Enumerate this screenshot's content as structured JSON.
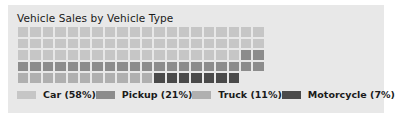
{
  "chart_data": {
    "type": "waffle",
    "title": "Vehicle Sales by Vehicle Type",
    "xlabel": "",
    "ylabel": "",
    "grid_columns": 20,
    "grid_rows": 5,
    "total_cells": 100,
    "fill_order": "bottom-left to top-right, column-major within rows",
    "legend_position": "bottom",
    "categories": [
      "Car",
      "Pickup",
      "Truck",
      "Motorcycle"
    ],
    "values": [
      58,
      21,
      11,
      7
    ],
    "value_unit": "percent",
    "series": [
      {
        "name": "Car",
        "value": 58,
        "label": "Car (58%)",
        "color": "#c6c6c6",
        "cells": 58
      },
      {
        "name": "Pickup",
        "value": 21,
        "label": "Pickup (21%)",
        "color": "#8c8c8c",
        "cells": 21
      },
      {
        "name": "Truck",
        "value": 11,
        "label": "Truck (11%)",
        "color": "#b0b0b0",
        "cells": 11
      },
      {
        "name": "Motorcycle",
        "value": 7,
        "label": "Motorcycle (7%)",
        "color": "#4a4a4a",
        "cells": 7
      }
    ],
    "empty_cells": 4,
    "empty_color": "#e8e8e8",
    "background_color": "#e8e8e8",
    "cell_layout_rows_top_to_bottom": [
      [
        "Car",
        "Car",
        "Car",
        "Car",
        "Car",
        "Car",
        "Car",
        "Car",
        "Car",
        "Car",
        "Car",
        "Car",
        "Car",
        "Car",
        "Car",
        "Car",
        "Car",
        "Car",
        "Car",
        "Car"
      ],
      [
        "Car",
        "Car",
        "Car",
        "Car",
        "Car",
        "Car",
        "Car",
        "Car",
        "Car",
        "Car",
        "Car",
        "Car",
        "Car",
        "Car",
        "Car",
        "Car",
        "Car",
        "Car",
        "Car",
        "Car"
      ],
      [
        "Car",
        "Car",
        "Car",
        "Car",
        "Car",
        "Car",
        "Car",
        "Car",
        "Car",
        "Car",
        "Car",
        "Car",
        "Car",
        "Car",
        "Car",
        "Car",
        "Car",
        "Car",
        "Pickup",
        "Pickup"
      ],
      [
        "Pickup",
        "Pickup",
        "Pickup",
        "Pickup",
        "Pickup",
        "Pickup",
        "Pickup",
        "Pickup",
        "Pickup",
        "Pickup",
        "Pickup",
        "Pickup",
        "Pickup",
        "Pickup",
        "Pickup",
        "Pickup",
        "Pickup",
        "Pickup",
        "Pickup",
        "Pickup"
      ],
      [
        "Truck",
        "Truck",
        "Truck",
        "Truck",
        "Truck",
        "Truck",
        "Truck",
        "Truck",
        "Truck",
        "Truck",
        "Truck",
        "Motorcycle",
        "Motorcycle",
        "Motorcycle",
        "Motorcycle",
        "Motorcycle",
        "Motorcycle",
        "Motorcycle",
        "empty",
        "empty"
      ]
    ]
  }
}
